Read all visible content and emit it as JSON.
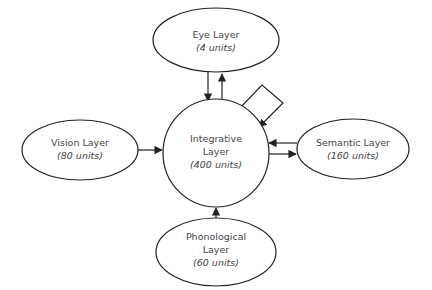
{
  "diagram": {
    "nodes": [
      {
        "id": "eye",
        "name": "Eye Layer",
        "lines": [
          "Eye Layer"
        ],
        "units": "(4 units)"
      },
      {
        "id": "vision",
        "name": "Vision Layer",
        "lines": [
          "Vision Layer"
        ],
        "units": "(80 units)"
      },
      {
        "id": "integrative",
        "name": "Integrative Layer",
        "lines": [
          "Integrative",
          "Layer"
        ],
        "units": "(400 units)"
      },
      {
        "id": "semantic",
        "name": "Semantic Layer",
        "lines": [
          "Semantic Layer"
        ],
        "units": "(160 units)"
      },
      {
        "id": "phonological",
        "name": "Phonological Layer",
        "lines": [
          "Phonological",
          "Layer"
        ],
        "units": "(60 units)"
      }
    ],
    "edges": [
      {
        "from": "eye",
        "to": "integrative"
      },
      {
        "from": "integrative",
        "to": "eye"
      },
      {
        "from": "vision",
        "to": "integrative"
      },
      {
        "from": "semantic",
        "to": "integrative"
      },
      {
        "from": "integrative",
        "to": "semantic"
      },
      {
        "from": "phonological",
        "to": "integrative"
      },
      {
        "from": "integrative",
        "to": "integrative",
        "type": "self-loop"
      }
    ],
    "colors": {
      "stroke": "#222222",
      "text": "#444444",
      "fill": "#ffffff"
    }
  }
}
